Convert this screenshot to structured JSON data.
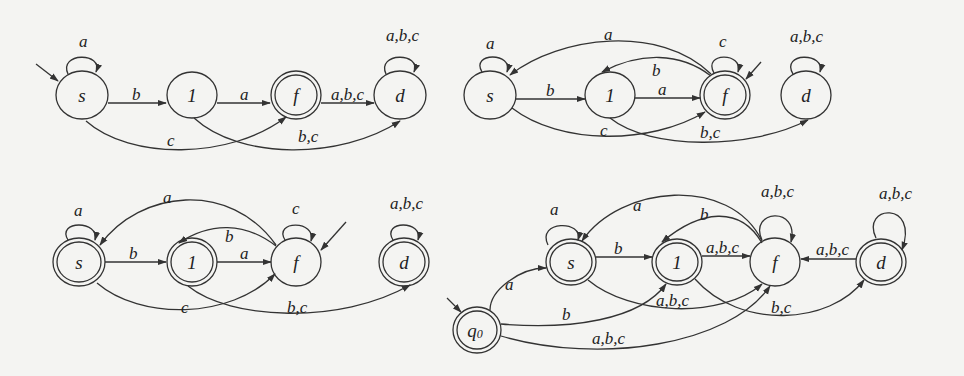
{
  "diagrams": [
    {
      "id": "dfa-1",
      "nodes": [
        {
          "id": "s",
          "label": "s",
          "x": 82,
          "y": 95,
          "accepting": false,
          "start": true
        },
        {
          "id": "1",
          "label": "1",
          "x": 192,
          "y": 95,
          "accepting": false,
          "start": false
        },
        {
          "id": "f",
          "label": "f",
          "x": 296,
          "y": 95,
          "accepting": true,
          "start": false
        },
        {
          "id": "d",
          "label": "d",
          "x": 400,
          "y": 95,
          "accepting": false,
          "start": false
        }
      ],
      "edges": [
        {
          "from": "s",
          "to": "s",
          "label": "a"
        },
        {
          "from": "s",
          "to": "1",
          "label": "b"
        },
        {
          "from": "1",
          "to": "f",
          "label": "a"
        },
        {
          "from": "f",
          "to": "d",
          "label": "a,b,c"
        },
        {
          "from": "d",
          "to": "d",
          "label": "a,b,c"
        },
        {
          "from": "s",
          "to": "f",
          "label": "c"
        },
        {
          "from": "1",
          "to": "d",
          "label": "b,c"
        }
      ]
    },
    {
      "id": "dfa-2",
      "nodes": [
        {
          "id": "s",
          "label": "s",
          "x": 490,
          "y": 95,
          "accepting": false,
          "start": false
        },
        {
          "id": "1",
          "label": "1",
          "x": 610,
          "y": 95,
          "accepting": false,
          "start": false
        },
        {
          "id": "f",
          "label": "f",
          "x": 725,
          "y": 95,
          "accepting": true,
          "start": true
        },
        {
          "id": "d",
          "label": "d",
          "x": 806,
          "y": 95,
          "accepting": false,
          "start": false
        }
      ],
      "edges": [
        {
          "from": "s",
          "to": "s",
          "label": "a"
        },
        {
          "from": "s",
          "to": "1",
          "label": "b"
        },
        {
          "from": "1",
          "to": "f",
          "label": "a"
        },
        {
          "from": "f",
          "to": "f",
          "label": "c"
        },
        {
          "from": "f",
          "to": "s",
          "label": "a"
        },
        {
          "from": "f",
          "to": "1",
          "label": "b"
        },
        {
          "from": "s",
          "to": "f",
          "label": "c"
        },
        {
          "from": "1",
          "to": "d",
          "label": "b,c"
        },
        {
          "from": "d",
          "to": "d",
          "label": "a,b,c"
        }
      ]
    },
    {
      "id": "dfa-3",
      "nodes": [
        {
          "id": "s",
          "label": "s",
          "x": 79,
          "y": 262,
          "accepting": true,
          "start": false
        },
        {
          "id": "1",
          "label": "1",
          "x": 192,
          "y": 262,
          "accepting": true,
          "start": false
        },
        {
          "id": "f",
          "label": "f",
          "x": 296,
          "y": 262,
          "accepting": false,
          "start": true
        },
        {
          "id": "d",
          "label": "d",
          "x": 404,
          "y": 262,
          "accepting": true,
          "start": false
        }
      ],
      "edges": [
        {
          "from": "s",
          "to": "s",
          "label": "a"
        },
        {
          "from": "s",
          "to": "1",
          "label": "b"
        },
        {
          "from": "1",
          "to": "f",
          "label": "a"
        },
        {
          "from": "f",
          "to": "f",
          "label": "c"
        },
        {
          "from": "f",
          "to": "s",
          "label": "a"
        },
        {
          "from": "f",
          "to": "1",
          "label": "b"
        },
        {
          "from": "s",
          "to": "f",
          "label": "c"
        },
        {
          "from": "1",
          "to": "d",
          "label": "b,c"
        },
        {
          "from": "d",
          "to": "d",
          "label": "a,b,c"
        }
      ]
    },
    {
      "id": "dfa-4",
      "nodes": [
        {
          "id": "q0",
          "label": "q",
          "sub": "0",
          "x": 477,
          "y": 330,
          "accepting": true,
          "start": true
        },
        {
          "id": "s",
          "label": "s",
          "x": 571,
          "y": 262,
          "accepting": true,
          "start": false
        },
        {
          "id": "1",
          "label": "1",
          "x": 677,
          "y": 262,
          "accepting": true,
          "start": false
        },
        {
          "id": "f",
          "label": "f",
          "x": 775,
          "y": 262,
          "accepting": false,
          "start": false
        },
        {
          "id": "d",
          "label": "d",
          "x": 881,
          "y": 262,
          "accepting": true,
          "start": false
        }
      ],
      "edges": [
        {
          "from": "q0",
          "to": "s",
          "label": "a"
        },
        {
          "from": "q0",
          "to": "1",
          "label": "b"
        },
        {
          "from": "q0",
          "to": "f",
          "label": "a,b,c"
        },
        {
          "from": "s",
          "to": "s",
          "label": "a"
        },
        {
          "from": "s",
          "to": "1",
          "label": "b"
        },
        {
          "from": "s",
          "to": "f",
          "label": "a,b,c"
        },
        {
          "from": "1",
          "to": "f",
          "label": "a,b,c"
        },
        {
          "from": "1",
          "to": "d",
          "label": "b,c"
        },
        {
          "from": "f",
          "to": "s",
          "label": "a"
        },
        {
          "from": "f",
          "to": "1",
          "label": "b"
        },
        {
          "from": "f",
          "to": "f",
          "label": "a,b,c"
        },
        {
          "from": "d",
          "to": "f",
          "label": "a,b,c"
        },
        {
          "from": "d",
          "to": "d",
          "label": "a,b,c"
        }
      ]
    }
  ],
  "labels": {
    "d1_s": "s",
    "d1_1": "1",
    "d1_f": "f",
    "d1_d": "d",
    "d1_e_ss": "a",
    "d1_e_s1": "b",
    "d1_e_1f": "a",
    "d1_e_fd": "a,b,c",
    "d1_e_dd": "a,b,c",
    "d1_e_sf": "c",
    "d1_e_1d": "b,c",
    "d2_s": "s",
    "d2_1": "1",
    "d2_f": "f",
    "d2_d": "d",
    "d2_e_ss": "a",
    "d2_e_s1": "b",
    "d2_e_1f": "a",
    "d2_e_ff": "c",
    "d2_e_fs": "a",
    "d2_e_f1": "b",
    "d2_e_sf": "c",
    "d2_e_1d": "b,c",
    "d2_e_dd": "a,b,c",
    "d3_s": "s",
    "d3_1": "1",
    "d3_f": "f",
    "d3_d": "d",
    "d3_e_ss": "a",
    "d3_e_s1": "b",
    "d3_e_1f": "a",
    "d3_e_ff": "c",
    "d3_e_fs": "a",
    "d3_e_f1": "b",
    "d3_e_sf": "c",
    "d3_e_1d": "b,c",
    "d3_e_dd": "a,b,c",
    "d4_q": "q",
    "d4_q_sub": "0",
    "d4_s": "s",
    "d4_1": "1",
    "d4_f": "f",
    "d4_d": "d",
    "d4_e_qs": "a",
    "d4_e_q1": "b",
    "d4_e_qf": "a,b,c",
    "d4_e_ss": "a",
    "d4_e_s1": "b",
    "d4_e_sf": "a,b,c",
    "d4_e_1f": "a,b,c",
    "d4_e_1d": "b,c",
    "d4_e_fs": "a",
    "d4_e_f1": "b",
    "d4_e_ff": "a,b,c",
    "d4_e_df": "a,b,c",
    "d4_e_dd": "a,b,c"
  }
}
